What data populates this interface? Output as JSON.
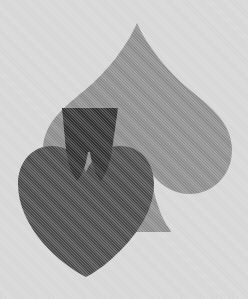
{
  "artwork": {
    "title": "Playing card suits emblem",
    "description": "Overlapping spade and heart card-suit symbols rendered in halftone grayscale",
    "background_color": "#ffffff",
    "width": 248,
    "height": 299,
    "style": "halftone dithered grayscale print",
    "shapes": [
      {
        "id": "spade",
        "name": "spade-suit",
        "label": "Spade",
        "color": "#a8a8a8",
        "z_order": 1,
        "tip": {
          "x": 137,
          "y": 23
        },
        "left_extent": 55,
        "right_extent": 230,
        "base_y": 232
      },
      {
        "id": "heart",
        "name": "heart-suit",
        "label": "Heart",
        "color": "#585858",
        "z_order": 2,
        "lobe_top_y": 148,
        "left_extent": 18,
        "right_extent": 152,
        "bottom_tip": {
          "x": 86,
          "y": 277
        }
      },
      {
        "id": "spade-stem",
        "name": "spade-stem",
        "label": "Spade stem",
        "color": "#3a3a3a",
        "z_order": 3,
        "top_y": 108,
        "bottom_y": 180,
        "top_width": 56,
        "bottom_width": 22
      }
    ]
  },
  "palette": {
    "spade_gray": "#a8a8a8",
    "heart_gray": "#585858",
    "stem_gray": "#3a3a3a",
    "background": "#ffffff"
  }
}
